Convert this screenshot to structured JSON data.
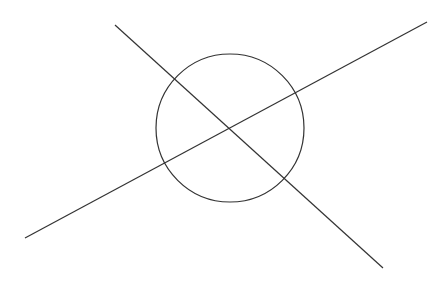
{
  "diagram": {
    "width": 445,
    "height": 283,
    "background": "#ffffff",
    "stroke_color": "#333333",
    "stroke_width": 1.2,
    "circle": {
      "cx": 230,
      "cy": 128,
      "r": 74
    },
    "lines": [
      {
        "id": "line-descending",
        "x1": 115,
        "y1": 25,
        "x2": 383,
        "y2": 268
      },
      {
        "id": "line-ascending",
        "x1": 25,
        "y1": 238,
        "x2": 427,
        "y2": 22
      }
    ]
  }
}
